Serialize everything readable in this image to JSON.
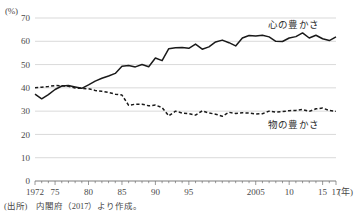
{
  "figure": {
    "y_axis_unit_label": "(%)",
    "x_axis_unit_label": "(年)",
    "source_note": "(出所)　内閣府（2017）より作成。"
  },
  "legend": {
    "spiritual_label": "心の豊かさ",
    "material_label": "物の豊かさ"
  },
  "chart_data": {
    "type": "line",
    "title": "",
    "xlabel": "(年)",
    "ylabel": "(%)",
    "ylim": [
      0,
      70
    ],
    "xlim": [
      1972,
      2017
    ],
    "grid": true,
    "legend_position": "inline-right",
    "ytick_labels": [
      "0",
      "10",
      "20",
      "30",
      "40",
      "50",
      "60",
      "70"
    ],
    "yticks": [
      0,
      10,
      20,
      30,
      40,
      50,
      60,
      70
    ],
    "xtick_labels": [
      "1972",
      "75",
      "80",
      "85",
      "90",
      "95",
      "2005",
      "10",
      "15",
      "17"
    ],
    "xticks": [
      1972,
      1975,
      1980,
      1985,
      1990,
      1995,
      2005,
      2010,
      2015,
      2017
    ],
    "x": [
      1972,
      1973,
      1974,
      1975,
      1976,
      1977,
      1978,
      1979,
      1980,
      1981,
      1982,
      1983,
      1984,
      1985,
      1986,
      1987,
      1988,
      1989,
      1990,
      1991,
      1992,
      1993,
      1994,
      1995,
      1996,
      1997,
      1998,
      1999,
      2000,
      2001,
      2002,
      2003,
      2004,
      2005,
      2006,
      2007,
      2008,
      2009,
      2010,
      2011,
      2012,
      2013,
      2014,
      2015,
      2016,
      2017
    ],
    "series": [
      {
        "name": "心の豊かさ",
        "style": "solid",
        "color": "#1a1a1a",
        "values": [
          37.3,
          35.3,
          37.1,
          39.3,
          40.8,
          41.0,
          40.4,
          39.8,
          41.3,
          42.9,
          44.1,
          45.1,
          46.2,
          49.3,
          49.6,
          49.0,
          50.0,
          49.1,
          52.8,
          51.7,
          56.8,
          57.2,
          57.3,
          57.0,
          58.8,
          56.6,
          57.6,
          59.7,
          60.5,
          59.4,
          58.0,
          61.4,
          62.5,
          62.3,
          62.6,
          61.9,
          60.0,
          59.9,
          61.4,
          62.0,
          63.6,
          61.4,
          62.6,
          61.1,
          60.3,
          61.9
        ]
      },
      {
        "name": "物の豊かさ",
        "style": "dashed",
        "color": "#1a1a1a",
        "values": [
          40.0,
          40.3,
          40.6,
          41.0,
          40.9,
          40.7,
          39.9,
          39.8,
          39.6,
          38.9,
          38.5,
          38.0,
          37.3,
          36.9,
          32.5,
          33.0,
          33.0,
          32.3,
          32.6,
          31.5,
          28.0,
          30.0,
          29.2,
          28.9,
          28.3,
          30.1,
          29.2,
          28.7,
          27.8,
          29.5,
          29.0,
          29.3,
          29.2,
          28.8,
          28.9,
          30.0,
          29.6,
          29.8,
          30.2,
          30.3,
          30.7,
          29.9,
          31.0,
          31.3,
          30.3,
          29.9
        ]
      }
    ]
  }
}
